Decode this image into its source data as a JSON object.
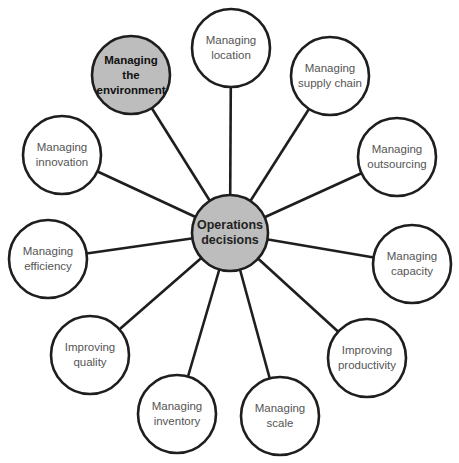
{
  "diagram": {
    "type": "hub-and-spoke",
    "colors": {
      "stroke": "#1e1e1e",
      "highlight_fill": "#bdbdbd",
      "normal_fill": "#ffffff",
      "normal_text": "#555555",
      "highlight_text": "#111111"
    },
    "hub": {
      "label_line1": "Operations",
      "label_line2": "decisions",
      "cx": 230,
      "cy": 233,
      "r": 38,
      "highlighted": true
    },
    "nodes": [
      {
        "label_line1": "Managing",
        "label_line2": "location",
        "cx": 231,
        "cy": 48,
        "r": 39,
        "highlighted": false
      },
      {
        "label_line1": "Managing",
        "label_line2": "supply chain",
        "cx": 330,
        "cy": 76,
        "r": 39,
        "highlighted": false
      },
      {
        "label_line1": "Managing",
        "label_line2": "outsourcing",
        "cx": 397,
        "cy": 157,
        "r": 39,
        "highlighted": false
      },
      {
        "label_line1": "Managing",
        "label_line2": "capacity",
        "cx": 412,
        "cy": 264,
        "r": 39,
        "highlighted": false
      },
      {
        "label_line1": "Improving",
        "label_line2": "productivity",
        "cx": 367,
        "cy": 358,
        "r": 39,
        "highlighted": false
      },
      {
        "label_line1": "Managing",
        "label_line2": "scale",
        "cx": 280,
        "cy": 416,
        "r": 39,
        "highlighted": false
      },
      {
        "label_line1": "Managing",
        "label_line2": "inventory",
        "cx": 177,
        "cy": 414,
        "r": 39,
        "highlighted": false
      },
      {
        "label_line1": "Improving",
        "label_line2": "quality",
        "cx": 90,
        "cy": 355,
        "r": 39,
        "highlighted": false
      },
      {
        "label_line1": "Managing",
        "label_line2": "efficiency",
        "cx": 48,
        "cy": 259,
        "r": 39,
        "highlighted": false
      },
      {
        "label_line1": "Managing",
        "label_line2": "innovation",
        "cx": 62,
        "cy": 155,
        "r": 39,
        "highlighted": false
      },
      {
        "label_line1": "Managing",
        "label_line2": "the",
        "label_line3": "environment",
        "cx": 131,
        "cy": 75,
        "r": 39,
        "highlighted": true
      }
    ]
  }
}
